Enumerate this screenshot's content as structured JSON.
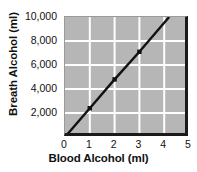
{
  "chart_data": {
    "type": "line",
    "title": "",
    "xlabel": "Blood Alcohol (ml)",
    "ylabel": "Breath Alcohol (ml)",
    "xlim": [
      0,
      5
    ],
    "ylim": [
      0,
      10000
    ],
    "xticks": [
      "0",
      "1",
      "2",
      "3",
      "4",
      "5"
    ],
    "xtick_values": [
      0,
      1,
      2,
      3,
      4,
      5
    ],
    "yticks": [
      "2,000",
      "4,000",
      "6,000",
      "8,000",
      "10,000"
    ],
    "ytick_values": [
      2000,
      4000,
      6000,
      8000,
      10000
    ],
    "grid": true,
    "grid_color": "#ffffff",
    "plot_background": "#b6b6b6",
    "line_color": "#111111",
    "marker": "square",
    "legend": "none",
    "series": [
      {
        "name": "Breath Alcohol vs Blood Alcohol",
        "x": [
          0,
          1,
          2,
          3,
          4.2
        ],
        "y": [
          0,
          2400,
          4800,
          7100,
          10000
        ],
        "markers_at": [
          {
            "x": 0,
            "y": 0
          },
          {
            "x": 1,
            "y": 2400
          },
          {
            "x": 2,
            "y": 4800
          },
          {
            "x": 3,
            "y": 7100
          }
        ]
      }
    ]
  }
}
